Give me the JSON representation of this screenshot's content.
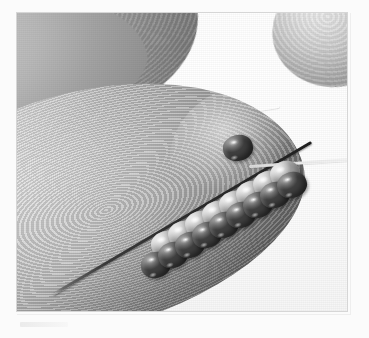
{
  "page": {
    "background_color": "#fbfbfb",
    "width": 369,
    "height": 338
  },
  "photo": {
    "frame_border_color": "#d6d6d6",
    "background_color": "#ffffff",
    "subject": "beading-needle-and-seed-beads-on-fingertip",
    "color_mode": "grayscale",
    "left": 16,
    "top": 12,
    "width": 332,
    "height": 300
  },
  "scene": {
    "hands": [
      {
        "name": "top-left-finger",
        "tone": "#a2a2a2",
        "focus": "out-of-focus"
      },
      {
        "name": "top-right-thumb-tip",
        "tone": "#d8d8d8",
        "focus": "out-of-focus"
      },
      {
        "name": "main-index-fingertip",
        "tone": "#c2c2c2",
        "focus": "in-focus"
      }
    ],
    "threads": [
      {
        "name": "upper-left-thread",
        "color": "#fdfdfd",
        "angle_deg": 24
      },
      {
        "name": "upper-mid-thread",
        "color": "#fbfbfb",
        "angle_deg": -9
      },
      {
        "name": "right-exit-thread",
        "color": "#e8e8e8",
        "angle_deg": -4
      }
    ],
    "needle": {
      "name": "beading-needle",
      "color": "#2b2b2b",
      "angle_deg": -30.5,
      "tip_direction": "lower-left",
      "eye_direction": "upper-right"
    },
    "bead_colors": {
      "light_matte": "#c9c9c9",
      "dark_glossy": "#6b6b6b",
      "highlight": "#ffffff"
    },
    "beads": [
      {
        "row": "light",
        "x": 96,
        "y": 118,
        "rot": -18,
        "z": 12
      },
      {
        "row": "light",
        "x": 113,
        "y": 108,
        "rot": -18,
        "z": 13
      },
      {
        "row": "light",
        "x": 130,
        "y": 98,
        "rot": -18,
        "z": 14
      },
      {
        "row": "light",
        "x": 147,
        "y": 88,
        "rot": -18,
        "z": 15
      },
      {
        "row": "light",
        "x": 164,
        "y": 78,
        "rot": -18,
        "z": 16
      },
      {
        "row": "light",
        "x": 181,
        "y": 68,
        "rot": -18,
        "z": 17
      },
      {
        "row": "light",
        "x": 198,
        "y": 58,
        "rot": -18,
        "z": 18
      },
      {
        "row": "light",
        "x": 215,
        "y": 48,
        "rot": -18,
        "z": 19
      },
      {
        "row": "dark",
        "x": 86,
        "y": 139,
        "rot": -18,
        "z": 22
      },
      {
        "row": "dark",
        "x": 103,
        "y": 129,
        "rot": -18,
        "z": 23
      },
      {
        "row": "dark",
        "x": 120,
        "y": 119,
        "rot": -18,
        "z": 24
      },
      {
        "row": "dark",
        "x": 137,
        "y": 109,
        "rot": -18,
        "z": 25
      },
      {
        "row": "dark",
        "x": 154,
        "y": 99,
        "rot": -18,
        "z": 26
      },
      {
        "row": "dark",
        "x": 171,
        "y": 89,
        "rot": -18,
        "z": 27
      },
      {
        "row": "dark",
        "x": 188,
        "y": 79,
        "rot": -18,
        "z": 28
      },
      {
        "row": "dark",
        "x": 205,
        "y": 69,
        "rot": -18,
        "z": 29
      },
      {
        "row": "dark",
        "x": 222,
        "y": 59,
        "rot": -18,
        "z": 30
      },
      {
        "row": "dark",
        "x": 168,
        "y": 22,
        "rot": -14,
        "z": 31
      }
    ]
  }
}
